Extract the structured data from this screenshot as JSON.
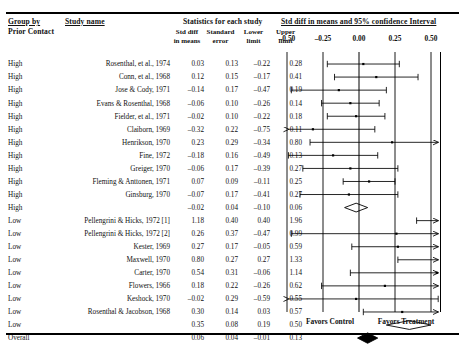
{
  "header": {
    "group_by": "Group by",
    "group_by_sub": "Prior Contact",
    "study_name": "Study name",
    "stats_title": "Statistics for each study",
    "plot_title": "Std diff in means and 95% confidence Interval",
    "columns": [
      "Std diff\nin means",
      "Standard\nerror",
      "Lower\nlimit",
      "Upper\nlimit"
    ],
    "col_effect_l1": "Std diff",
    "col_effect_l2": "in means",
    "col_se_l1": "Standard",
    "col_se_l2": "error",
    "col_lo_l1": "Lower",
    "col_lo_l2": "limit",
    "col_up_l1": "Upper",
    "col_up_l2": "limit"
  },
  "axis": {
    "ticks": [
      "-0.50",
      "-0.25",
      "0.00",
      "0.25",
      "0.50"
    ],
    "tick_values": [
      -0.5,
      -0.25,
      0.0,
      0.25,
      0.5
    ],
    "min": -0.5,
    "max": 0.5,
    "favors_left": "Favors Control",
    "favors_right": "Favors Treatment"
  },
  "chart_data": {
    "type": "forest",
    "title": "Std diff in means and 95% confidence Interval",
    "xlabel": "",
    "ylabel": "",
    "xlim": [
      -0.5,
      0.5
    ],
    "grid": true,
    "legend": [
      "Favors Control",
      "Favors Treatment"
    ],
    "columns": [
      "Prior Contact",
      "Study name",
      "Std diff in means",
      "Standard error",
      "Lower limit",
      "Upper limit"
    ],
    "rows": [
      {
        "group": "High",
        "study": "Rosenthal, et al., 1974",
        "effect": 0.03,
        "se": 0.13,
        "lower": -0.22,
        "upper": 0.28,
        "kind": "study"
      },
      {
        "group": "High",
        "study": "Conn, et al., 1968",
        "effect": 0.12,
        "se": 0.15,
        "lower": -0.17,
        "upper": 0.41,
        "kind": "study"
      },
      {
        "group": "High",
        "study": "Jose & Cody, 1971",
        "effect": -0.14,
        "se": 0.17,
        "lower": -0.47,
        "upper": 0.19,
        "kind": "study"
      },
      {
        "group": "High",
        "study": "Evans & Rosenthal, 1968",
        "effect": -0.06,
        "se": 0.1,
        "lower": -0.26,
        "upper": 0.14,
        "kind": "study"
      },
      {
        "group": "High",
        "study": "Fielder, et al., 1971",
        "effect": -0.02,
        "se": 0.1,
        "lower": -0.22,
        "upper": 0.18,
        "kind": "study"
      },
      {
        "group": "High",
        "study": "Claiborn, 1969",
        "effect": -0.32,
        "se": 0.22,
        "lower": -0.75,
        "upper": 0.11,
        "kind": "study"
      },
      {
        "group": "High",
        "study": "Henrikson, 1970",
        "effect": 0.23,
        "se": 0.29,
        "lower": -0.34,
        "upper": 0.8,
        "kind": "study"
      },
      {
        "group": "High",
        "study": "Fine, 1972",
        "effect": -0.18,
        "se": 0.16,
        "lower": -0.49,
        "upper": 0.13,
        "kind": "study"
      },
      {
        "group": "High",
        "study": "Greiger, 1970",
        "effect": -0.06,
        "se": 0.17,
        "lower": -0.39,
        "upper": 0.27,
        "kind": "study"
      },
      {
        "group": "High",
        "study": "Fleming & Anttonen, 1971",
        "effect": 0.07,
        "se": 0.09,
        "lower": -0.11,
        "upper": 0.25,
        "kind": "study"
      },
      {
        "group": "High",
        "study": "Ginsburg, 1970",
        "effect": -0.07,
        "se": 0.17,
        "lower": -0.41,
        "upper": 0.27,
        "kind": "study"
      },
      {
        "group": "High",
        "study": "",
        "effect": -0.02,
        "se": 0.04,
        "lower": -0.1,
        "upper": 0.06,
        "kind": "subtotal"
      },
      {
        "group": "Low",
        "study": "Pellengrini & Hicks, 1972 [1]",
        "effect": 1.18,
        "se": 0.4,
        "lower": 0.4,
        "upper": 1.96,
        "kind": "study"
      },
      {
        "group": "Low",
        "study": "Pellengrini & Hicks, 1972 [2]",
        "effect": 0.26,
        "se": 0.37,
        "lower": -0.47,
        "upper": 0.99,
        "kind": "study"
      },
      {
        "group": "Low",
        "study": "Kester, 1969",
        "effect": 0.27,
        "se": 0.17,
        "lower": -0.05,
        "upper": 0.59,
        "kind": "study"
      },
      {
        "group": "Low",
        "study": "Maxwell, 1970",
        "effect": 0.8,
        "se": 0.27,
        "lower": 0.27,
        "upper": 1.33,
        "kind": "study"
      },
      {
        "group": "Low",
        "study": "Carter, 1970",
        "effect": 0.54,
        "se": 0.31,
        "lower": -0.06,
        "upper": 1.14,
        "kind": "study"
      },
      {
        "group": "Low",
        "study": "Flowers, 1966",
        "effect": 0.18,
        "se": 0.22,
        "lower": -0.26,
        "upper": 0.62,
        "kind": "study"
      },
      {
        "group": "Low",
        "study": "Keshock, 1970",
        "effect": -0.02,
        "se": 0.29,
        "lower": -0.59,
        "upper": 0.55,
        "kind": "study"
      },
      {
        "group": "Low",
        "study": "Rosenthal & Jacobson, 1968",
        "effect": 0.3,
        "se": 0.14,
        "lower": 0.03,
        "upper": 0.57,
        "kind": "study"
      },
      {
        "group": "Low",
        "study": "",
        "effect": 0.35,
        "se": 0.08,
        "lower": 0.19,
        "upper": 0.5,
        "kind": "subtotal"
      },
      {
        "group": "Overall",
        "study": "",
        "effect": 0.06,
        "se": 0.04,
        "lower": -0.01,
        "upper": 0.13,
        "kind": "overall"
      }
    ]
  }
}
